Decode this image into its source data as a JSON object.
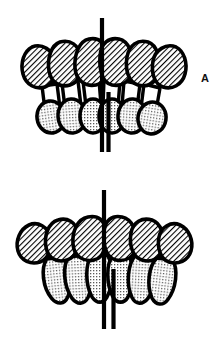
{
  "figure": {
    "type": "dental-occlusion-illustration",
    "background_color": "#ffffff",
    "outline_color": "#000000",
    "upper_tooth_fill": "#b4b4b4",
    "upper_tooth_pattern": "diagonal-hatch",
    "lower_tooth_fill": "#d9d9d9",
    "lower_tooth_pattern": "stipple-dots",
    "midline_color": "#000000"
  },
  "panels": [
    {
      "id": "A",
      "label": "A",
      "upper_arch": {
        "name": "maxillary-anterior-teeth",
        "tooth_count": 6,
        "shape": "broad-rounded",
        "fill": "#b4b4b4",
        "pattern": "diagonal-hatch"
      },
      "lower_arch": {
        "name": "mandibular-anterior-teeth",
        "tooth_count": 6,
        "shape": "oval-rounded",
        "fill": "#d9d9d9",
        "pattern": "stipple-dots"
      },
      "midlines": [
        {
          "name": "maxillary-midline",
          "x": 102,
          "y_top": 18,
          "y_bottom": 152,
          "width": 4
        },
        {
          "name": "mandibular-midline",
          "x": 108,
          "y_top": 92,
          "y_bottom": 152,
          "width": 4
        }
      ],
      "midline_offset_px": 6
    },
    {
      "id": "B",
      "label": "B",
      "upper_arch": {
        "name": "maxillary-anterior-teeth",
        "tooth_count": 6,
        "shape": "broad-rounded",
        "fill": "#b4b4b4",
        "pattern": "diagonal-hatch"
      },
      "lower_arch": {
        "name": "mandibular-anterior-teeth",
        "tooth_count": 6,
        "shape": "narrow-elongated",
        "fill": "#d9d9d9",
        "pattern": "stipple-dots"
      },
      "midlines": [
        {
          "name": "maxillary-midline",
          "x": 104,
          "y_top": 16,
          "y_bottom": 155,
          "width": 4
        },
        {
          "name": "mandibular-midline",
          "x": 113,
          "y_top": 95,
          "y_bottom": 155,
          "width": 4
        }
      ],
      "midline_offset_px": 9
    }
  ]
}
